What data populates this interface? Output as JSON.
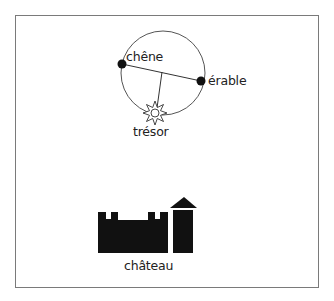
{
  "diagram": {
    "labels": {
      "oak": "chêne",
      "maple": "érable",
      "treasure": "trésor",
      "castle": "château"
    },
    "colors": {
      "frame": "#7a7a7a",
      "ink": "#111111",
      "circle": "#555555"
    }
  }
}
